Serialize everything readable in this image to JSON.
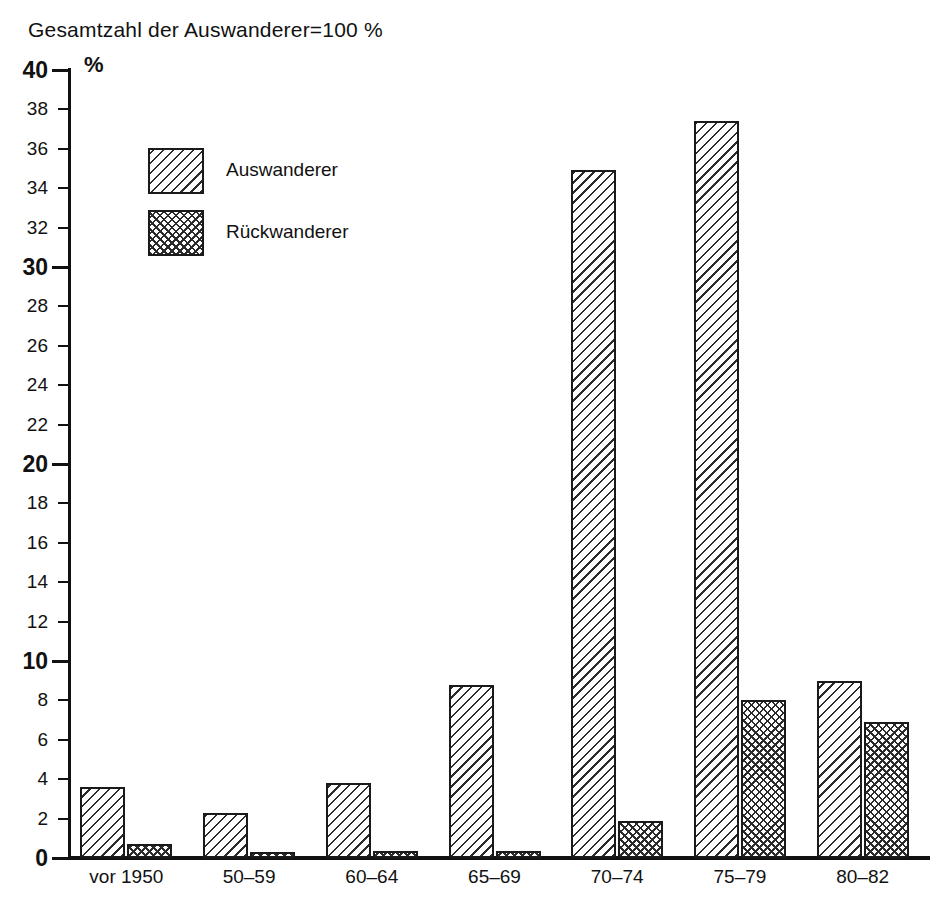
{
  "title": "Gesamtzahl der Auswanderer=100 %",
  "unit_label": "%",
  "legend": {
    "items": [
      {
        "label": "Auswanderer",
        "pattern": "diagonal-hatch"
      },
      {
        "label": "Rückwanderer",
        "pattern": "cross-hatch"
      }
    ]
  },
  "chart_data": {
    "type": "bar",
    "title": "Gesamtzahl der Auswanderer=100 %",
    "xlabel": "",
    "ylabel": "%",
    "ylim": [
      0,
      40
    ],
    "ytick_step": 2,
    "ytick_labels": [
      "0",
      "2",
      "4",
      "6",
      "8",
      "10",
      "12",
      "14",
      "16",
      "18",
      "20",
      "22",
      "24",
      "26",
      "28",
      "30",
      "32",
      "34",
      "36",
      "38",
      "40"
    ],
    "ytick_major": [
      "0",
      "10",
      "20",
      "30",
      "40"
    ],
    "grid": false,
    "legend_position": "upper-left-inside",
    "categories": [
      "vor 1950",
      "50–59",
      "60–64",
      "65–69",
      "70–74",
      "75–79",
      "80–82"
    ],
    "series": [
      {
        "name": "Auswanderer",
        "values": [
          3.6,
          2.3,
          3.8,
          8.8,
          34.9,
          37.4,
          9.0
        ]
      },
      {
        "name": "Rückwanderer",
        "values": [
          0.7,
          0.3,
          0.35,
          0.35,
          1.9,
          8.0,
          6.9
        ]
      }
    ]
  }
}
